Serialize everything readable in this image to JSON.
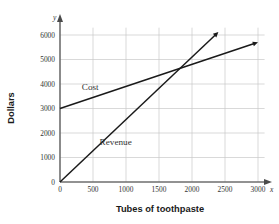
{
  "chart_data": {
    "type": "line",
    "title": "",
    "xlabel": "Tubes of toothpaste",
    "ylabel": "Dollars",
    "xlim": [
      0,
      3150
    ],
    "ylim": [
      0,
      6400
    ],
    "grid": true,
    "legend_position": "inline-annotation",
    "x_axis_letter": "y",
    "y_axis_letter": "x",
    "xticks": [
      0,
      500,
      1000,
      1500,
      2000,
      2500,
      3000
    ],
    "xtick_labels": [
      "0",
      "500",
      "1000",
      "1500",
      "2000",
      "2500",
      "3000"
    ],
    "yticks": [
      0,
      1000,
      2000,
      3000,
      4000,
      5000,
      6000
    ],
    "ytick_labels": [
      "0",
      "1000",
      "2000",
      "3000",
      "4000",
      "5000",
      "6000"
    ],
    "series": [
      {
        "name": "Cost",
        "label": "Cost",
        "color": "#1a1a1a",
        "intercept": 3000,
        "slope": 0.9,
        "x": [
          0,
          3000
        ],
        "values": [
          3000,
          5700
        ],
        "arrow_end": true,
        "label_x": 330,
        "label_y": 3760
      },
      {
        "name": "Revenue",
        "label": "Revenue",
        "color": "#1a1a1a",
        "intercept": 0,
        "slope": 2.55,
        "x": [
          0,
          2400
        ],
        "values": [
          0,
          6120
        ],
        "arrow_end": true,
        "label_x": 600,
        "label_y": 1500
      }
    ],
    "annotations": [
      {
        "name": "break-even-intersection",
        "x": 1818,
        "y": 4636
      }
    ]
  },
  "axis_titles": {
    "x": "Tubes of toothpaste",
    "y": "Dollars"
  },
  "axis_letters": {
    "x": "x",
    "y": "y"
  },
  "colors": {
    "grid": "#c9c9c9",
    "axis": "#6e6e6e",
    "line": "#1a1a1a",
    "text": "#333333",
    "background": "#ffffff"
  }
}
